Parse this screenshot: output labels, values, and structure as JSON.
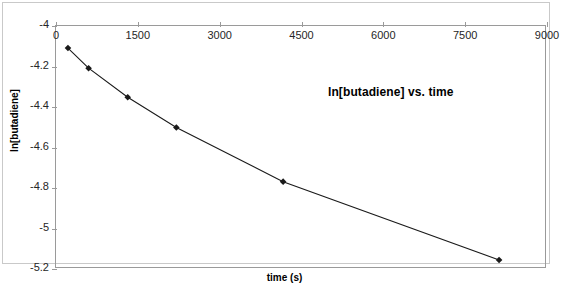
{
  "chart_data": {
    "type": "line",
    "title": "ln[butadiene] vs. time",
    "xlabel": "time (s)",
    "ylabel": "ln[butadiene]",
    "xlim": [
      0,
      9000
    ],
    "ylim": [
      -5.2,
      -4.0
    ],
    "xticks": [
      "0",
      "1500",
      "3000",
      "4500",
      "6000",
      "7500",
      "9000"
    ],
    "xtick_values": [
      0,
      1500,
      3000,
      4500,
      6000,
      7500,
      9000
    ],
    "yticks": [
      "-4",
      "-4.2",
      "-4.4",
      "-4.6",
      "-4.8",
      "-5",
      "-5.2"
    ],
    "ytick_values": [
      -4.0,
      -4.2,
      -4.4,
      -4.6,
      -4.8,
      -5.0,
      -5.2
    ],
    "grid": false,
    "legend": false,
    "marker": "diamond",
    "series": [
      {
        "name": "ln[butadiene]",
        "color": "#1a1a1a",
        "x": [
          220,
          600,
          1320,
          2215,
          4180,
          8155
        ],
        "y": [
          -4.11,
          -4.21,
          -4.355,
          -4.505,
          -4.775,
          -5.165
        ]
      }
    ]
  },
  "axis_color": "#9a9a9a",
  "frame_color": "#c9c9c9",
  "background": "#ffffff"
}
